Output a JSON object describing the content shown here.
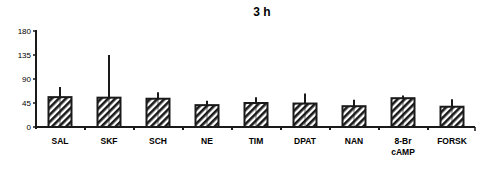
{
  "chart_data": {
    "type": "bar",
    "title": "3 h",
    "xlabel": "",
    "ylabel": "",
    "ylim": [
      0,
      180
    ],
    "yticks": [
      0,
      45,
      90,
      135,
      180
    ],
    "grid": false,
    "legend": null,
    "categories": [
      "SAL",
      "SKF",
      "SCH",
      "NE",
      "TIM",
      "DPAT",
      "NAN",
      "8-Br cAMP",
      "FORSK"
    ],
    "category_lines": [
      [
        "SAL"
      ],
      [
        "SKF"
      ],
      [
        "SCH"
      ],
      [
        "NE"
      ],
      [
        "TIM"
      ],
      [
        "DPAT"
      ],
      [
        "NAN"
      ],
      [
        "8-Br",
        "cAMP"
      ],
      [
        "FORSK"
      ]
    ],
    "values": [
      56,
      55,
      53,
      41,
      45,
      44,
      39,
      54,
      38
    ],
    "error_upper": [
      75,
      135,
      65,
      49,
      56,
      63,
      51,
      59,
      52
    ],
    "bar_fill": "hatched",
    "colors": {
      "bar_edge": "#1a1a1a",
      "hatch": "#1a1a1a",
      "background": "#ffffff"
    }
  }
}
